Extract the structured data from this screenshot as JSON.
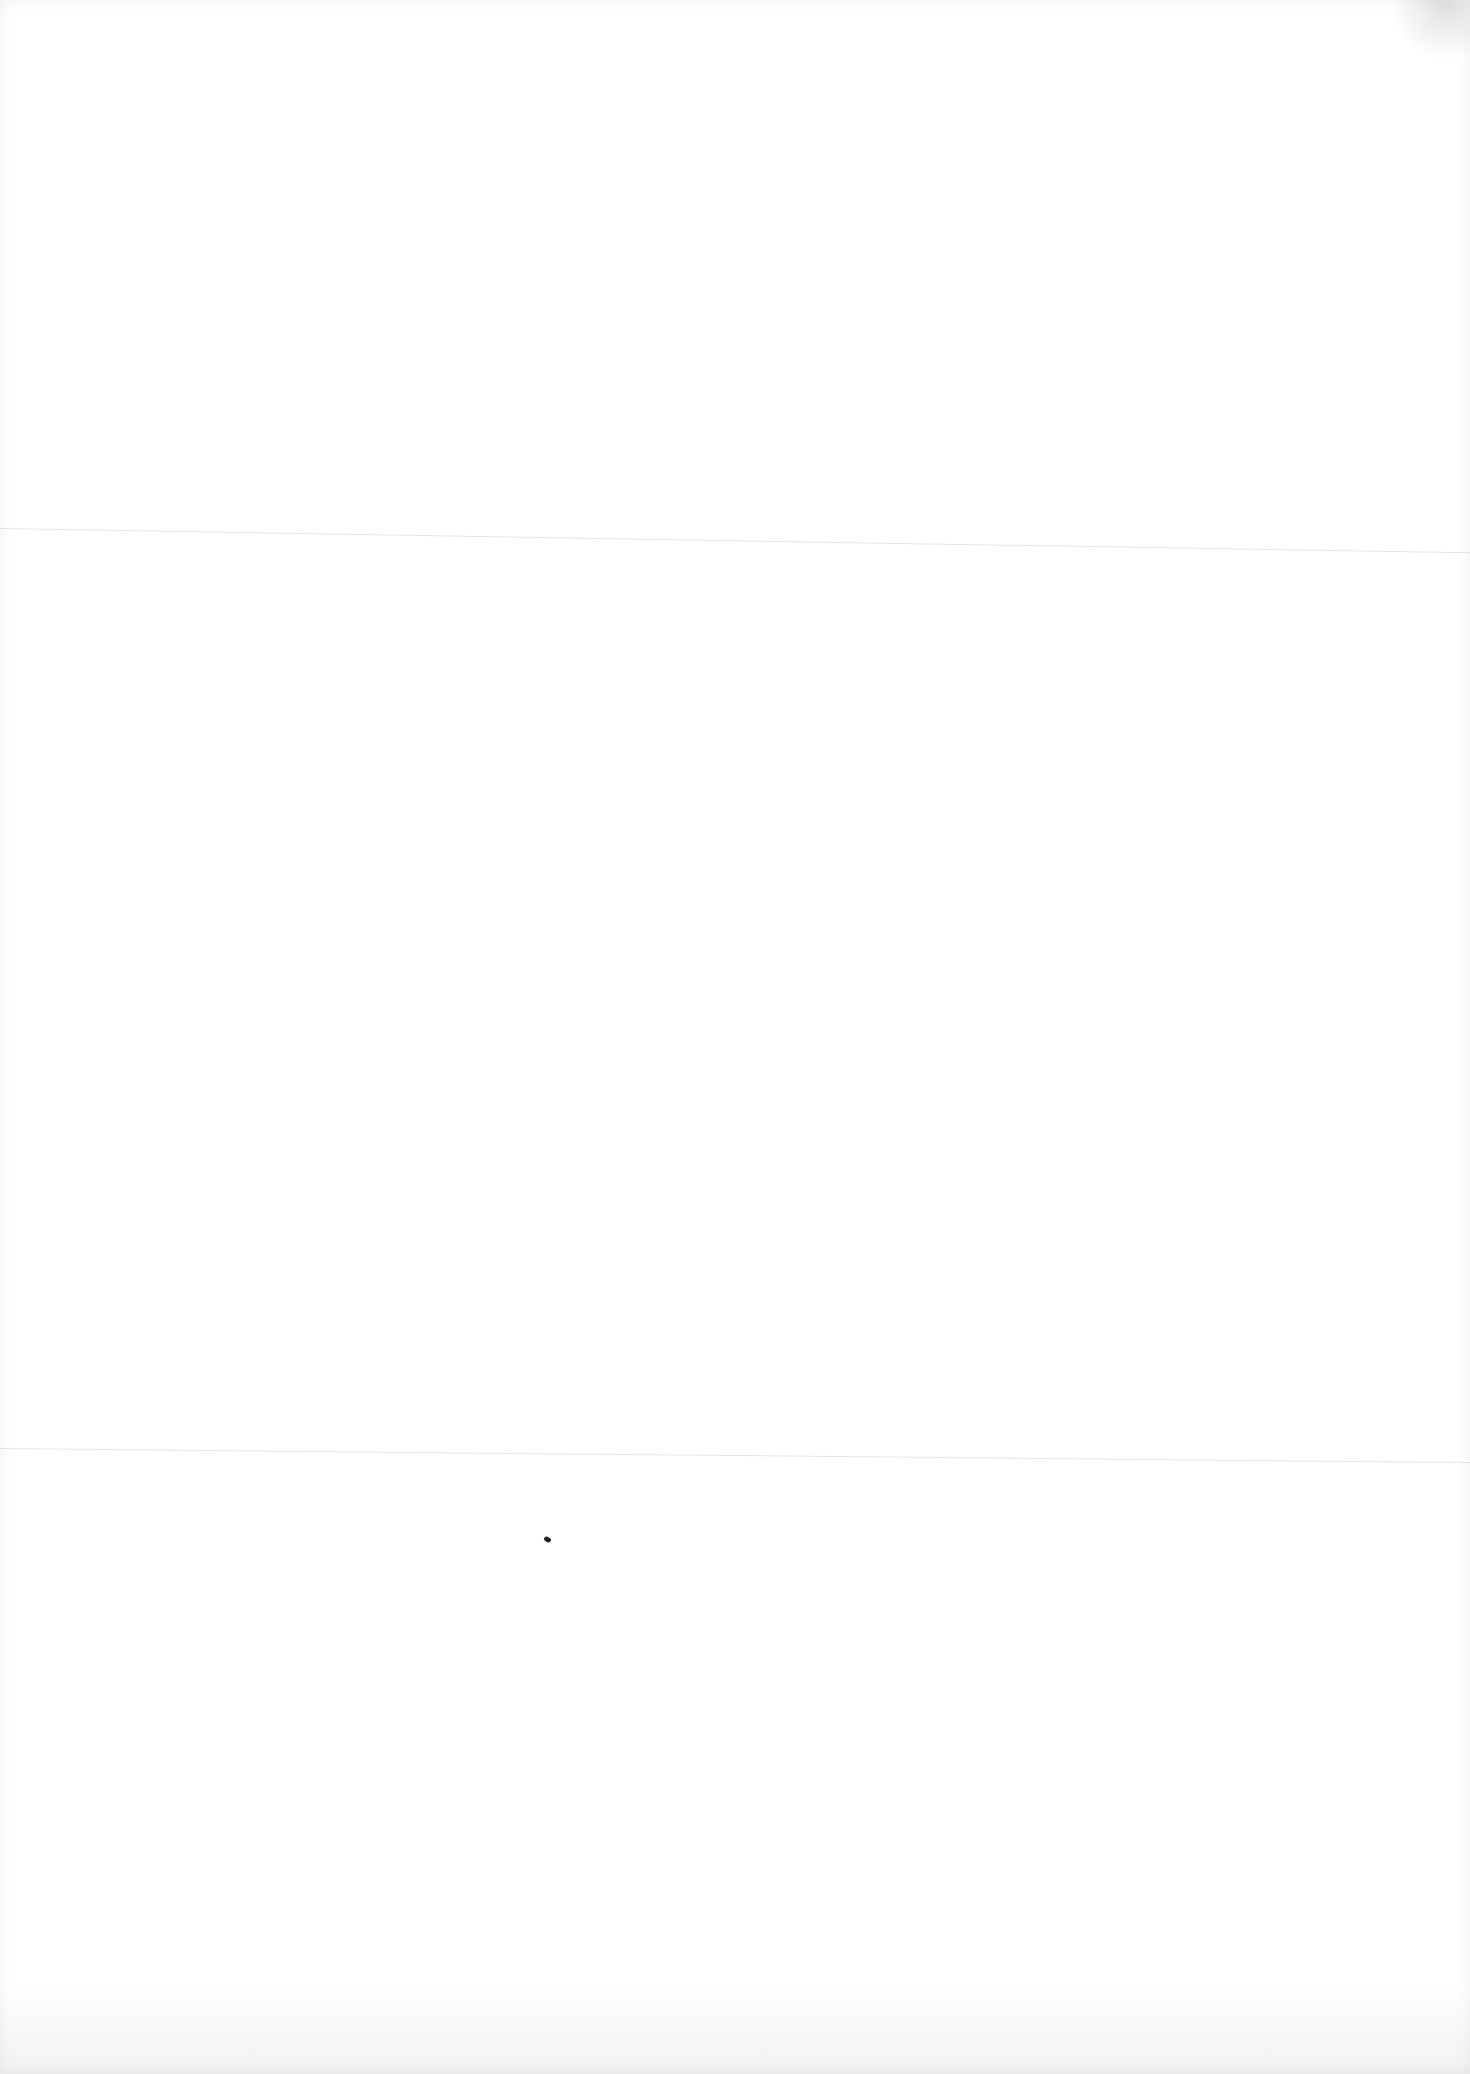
{
  "page": {
    "type": "blank-scanned-sheet",
    "text_content": "",
    "background_color": "#ffffff",
    "artifacts": [
      "horizontal-fold-line",
      "horizontal-fold-line",
      "ink-speck",
      "edge-wear"
    ]
  }
}
